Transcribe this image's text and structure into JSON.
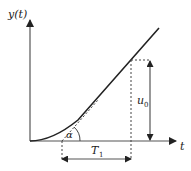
{
  "diagram": {
    "type": "step-response-tangent",
    "labels": {
      "y_axis": "y(t)",
      "x_axis": "t",
      "angle": "α",
      "time_constant": "T",
      "time_constant_sub": "1",
      "amplitude": "u",
      "amplitude_sub": "0"
    },
    "colors": {
      "line": "#222222",
      "axis": "#555555",
      "dashed": "#444444"
    }
  }
}
